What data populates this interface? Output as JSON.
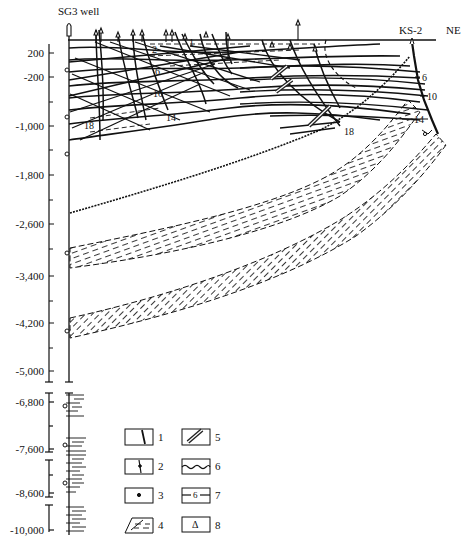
{
  "labels": {
    "well_left": "SG3 well",
    "well_right": "KS-2",
    "direction": "NE"
  },
  "depth_axis": {
    "upper": [
      {
        "label": "200",
        "y": 53
      },
      {
        "label": "-200",
        "y": 77
      },
      {
        "label": "-1,000",
        "y": 126
      },
      {
        "label": "-1,800",
        "y": 175
      },
      {
        "label": "-2,600",
        "y": 224
      },
      {
        "label": "-3,400",
        "y": 276
      },
      {
        "label": "-4,200",
        "y": 323
      },
      {
        "label": "-5,000",
        "y": 371
      }
    ],
    "lower": [
      {
        "label": "-6,800",
        "y": 402
      },
      {
        "label": "-7,600",
        "y": 449
      },
      {
        "label": "-8,600",
        "y": 493
      },
      {
        "label": "-10,000",
        "y": 530
      }
    ]
  },
  "horizon_labels": [
    {
      "text": "1",
      "x": 189,
      "y": 42
    },
    {
      "text": "2",
      "x": 152,
      "y": 49
    },
    {
      "text": "6",
      "x": 155,
      "y": 71
    },
    {
      "text": "10",
      "x": 157,
      "y": 93
    },
    {
      "text": "14",
      "x": 170,
      "y": 117
    },
    {
      "text": "18",
      "x": 86,
      "y": 125
    },
    {
      "text": "18",
      "x": 346,
      "y": 125
    },
    {
      "text": "6",
      "x": 422,
      "y": 76
    },
    {
      "text": "10",
      "x": 427,
      "y": 95
    },
    {
      "text": "14",
      "x": 411,
      "y": 119
    }
  ],
  "legend": {
    "items": [
      {
        "num": "1",
        "symbol": "fault-line"
      },
      {
        "num": "2",
        "symbol": "fault-with-dot"
      },
      {
        "num": "3",
        "symbol": "point-marker"
      },
      {
        "num": "4",
        "symbol": "dashed-hatch-layer"
      },
      {
        "num": "5",
        "symbol": "triple-hatched-band"
      },
      {
        "num": "6",
        "symbol": "wavy-unconformity"
      },
      {
        "num": "7",
        "symbol": "horizon-line-6"
      },
      {
        "num": "8",
        "symbol": "triangle-marker"
      }
    ],
    "item7_inner": "6",
    "item8_glyph": "Δ"
  }
}
